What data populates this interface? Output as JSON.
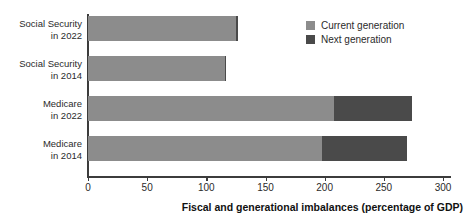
{
  "chart_data": {
    "type": "bar",
    "orientation": "horizontal",
    "stacked": true,
    "title": "",
    "xlabel": "Fiscal and generational imbalances (percentage of GDP)",
    "ylabel": "",
    "xlim": [
      0,
      300
    ],
    "xticks": [
      "0",
      "50",
      "100",
      "150",
      "200",
      "250",
      "300"
    ],
    "xtick_values": [
      0,
      50,
      100,
      150,
      200,
      250,
      300
    ],
    "grid": false,
    "legend_position": "top-right",
    "categories": [
      "Social Security\nin 2022",
      "Social Security\nin 2014",
      "Medicare\nin 2022",
      "Medicare\nin 2014"
    ],
    "category_lines": [
      [
        "Social Security",
        "in 2022"
      ],
      [
        "Social Security",
        "in 2014"
      ],
      [
        "Medicare",
        "in 2022"
      ],
      [
        "Medicare",
        "in 2014"
      ]
    ],
    "series": [
      {
        "name": "Current generation",
        "color": "#8c8c8c",
        "values": [
          125,
          116,
          208,
          198
        ]
      },
      {
        "name": "Next generation",
        "color": "#4a4a4a",
        "values": [
          2,
          1,
          66,
          72
        ]
      }
    ],
    "totals": [
      127,
      117,
      274,
      270
    ]
  },
  "legend": {
    "items": [
      {
        "label": "Current generation",
        "color": "#8c8c8c",
        "swatch": "current"
      },
      {
        "label": "Next generation",
        "color": "#4a4a4a",
        "swatch": "next"
      }
    ]
  },
  "colors": {
    "current_generation": "#8c8c8c",
    "next_generation": "#4a4a4a",
    "axis": "#3c3c3c",
    "background": "#ffffff",
    "text": "#2b2b2b"
  }
}
